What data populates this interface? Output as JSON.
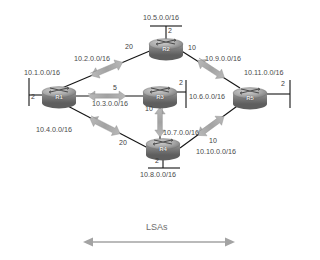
{
  "diagram": {
    "background": "#ffffff",
    "link_color": "#1a1a1a",
    "arrow_color": "#9e9e9e",
    "text_color": "#4a4a4a",
    "router_body_color": "#8a8a8a",
    "router_top_color": "#b5b5b5"
  },
  "routers": [
    {
      "id": "R1",
      "label": "R1",
      "x": 52,
      "y": 93
    },
    {
      "id": "R2",
      "label": "R2",
      "x": 165,
      "y": 45
    },
    {
      "id": "R3",
      "label": "R3",
      "x": 158,
      "y": 93
    },
    {
      "id": "R4",
      "label": "R4",
      "x": 158,
      "y": 146
    },
    {
      "id": "R5",
      "label": "R5",
      "x": 248,
      "y": 93
    }
  ],
  "stub_networks": [
    {
      "id": "stub-r1",
      "network": "10.1.0.0/16",
      "cost": "2",
      "router": "R1",
      "side": "left"
    },
    {
      "id": "stub-r2",
      "network": "10.5.0.0/16",
      "cost": "2",
      "router": "R2",
      "side": "top"
    },
    {
      "id": "stub-r3",
      "network": "10.6.0.0/16",
      "cost": "2",
      "router": "R3",
      "side": "right"
    },
    {
      "id": "stub-r4",
      "network": "10.8.0.0/16",
      "cost": "2",
      "router": "R4",
      "side": "bottom"
    },
    {
      "id": "stub-r5",
      "network": "10.11.0.0/16",
      "cost": "2",
      "router": "R5",
      "side": "right"
    }
  ],
  "links": [
    {
      "id": "link-r1-r2",
      "from": "R1",
      "to": "R2",
      "network": "10.2.0.0/16",
      "cost": "20"
    },
    {
      "id": "link-r2-r5",
      "from": "R2",
      "to": "R5",
      "network": "10.9.0.0/16",
      "cost": "10"
    },
    {
      "id": "link-r1-r3",
      "from": "R1",
      "to": "R3",
      "network": "10.3.0.0/16",
      "cost": "5"
    },
    {
      "id": "link-r3-r4",
      "from": "R3",
      "to": "R4",
      "network": "10.7.0.0/16",
      "cost": "10"
    },
    {
      "id": "link-r1-r4",
      "from": "R1",
      "to": "R4",
      "network": "10.4.0.0/16",
      "cost": "20"
    },
    {
      "id": "link-r4-r5",
      "from": "R4",
      "to": "R5",
      "network": "10.10.0.0/16",
      "cost": "10"
    }
  ],
  "legend": {
    "lsas_label": "LSAs"
  }
}
